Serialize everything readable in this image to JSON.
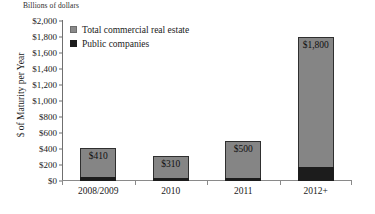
{
  "chart_data": {
    "type": "bar",
    "title": "Billions of dollars",
    "xlabel": "",
    "ylabel": "$ of Maturity per Year",
    "categories": [
      "2008/2009",
      "2010",
      "2011",
      "2012+"
    ],
    "series": [
      {
        "name": "Total commercial real estate",
        "color": "#858585",
        "values": [
          410,
          310,
          500,
          1800
        ],
        "data_labels": [
          "$410",
          "$310",
          "$500",
          "$1,800"
        ]
      },
      {
        "name": "Public companies",
        "color": "#1c1c1c",
        "values": [
          45,
          40,
          35,
          175
        ],
        "data_labels": [
          "",
          "",
          "",
          ""
        ]
      }
    ],
    "stacked": true,
    "ylim": [
      0,
      2000
    ],
    "ytick_values": [
      0,
      200,
      400,
      600,
      800,
      1000,
      1200,
      1400,
      1600,
      1800,
      2000
    ],
    "ytick_labels": [
      "$0",
      "$200",
      "$400",
      "$600",
      "$800",
      "$1,000",
      "$1,200",
      "$1,400",
      "$1,600",
      "$1,800",
      "$2,000"
    ],
    "grid": false,
    "legend_position": "top-left-inside"
  },
  "legend": {
    "items": [
      {
        "label": "Total commercial real estate",
        "swatch": "gray-square-swatch"
      },
      {
        "label": "Public companies",
        "swatch": "black-square-swatch"
      }
    ]
  }
}
